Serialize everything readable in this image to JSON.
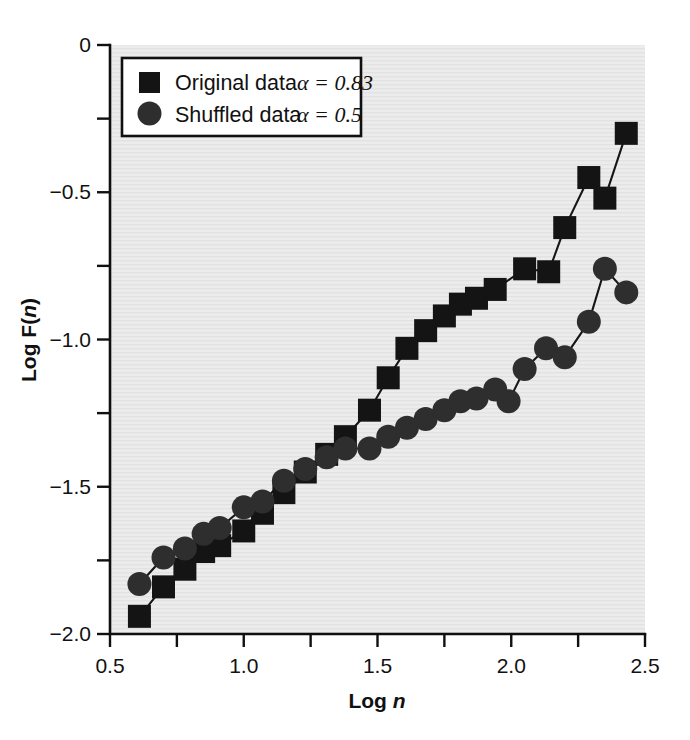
{
  "figure": {
    "background_color": "#ffffff",
    "plot_background_color": "#ececec",
    "axis_color": "#101010"
  },
  "chart_data": {
    "type": "line",
    "title": "",
    "subtitle": "",
    "xlabel_prefix": "Log ",
    "xlabel_italic": "n",
    "ylabel_prefix": "Log F(",
    "ylabel_italic": "n",
    "ylabel_suffix": ")",
    "xlim": [
      0.5,
      2.5
    ],
    "ylim": [
      -2.0,
      0.0
    ],
    "grid": false,
    "xticks": [
      0.5,
      1.0,
      1.5,
      2.0,
      2.5
    ],
    "xticklabels": [
      "0.5",
      "1.0",
      "1.5",
      "2.0",
      "2.5"
    ],
    "xticks_minor": [
      0.75,
      1.25,
      1.75,
      2.25
    ],
    "yticks": [
      0.0,
      -0.5,
      -1.0,
      -1.5,
      -2.0
    ],
    "yticklabels": [
      "0",
      "−0.5",
      "−1.0",
      "−1.5",
      "−2.0"
    ],
    "yticks_minor": [
      -0.25,
      -0.75,
      -1.25,
      -1.75
    ],
    "legend_position": "upper-left",
    "series": [
      {
        "name": "Original data",
        "alpha_label": "α = 0.83",
        "alpha_value": 0.83,
        "marker": "square",
        "color": "#141414",
        "x": [
          0.61,
          0.7,
          0.78,
          0.85,
          0.91,
          1.0,
          1.07,
          1.15,
          1.23,
          1.31,
          1.38,
          1.47,
          1.54,
          1.61,
          1.68,
          1.75,
          1.81,
          1.87,
          1.94,
          2.05,
          2.14,
          2.2,
          2.29,
          2.35,
          2.43
        ],
        "y": [
          -1.94,
          -1.84,
          -1.78,
          -1.72,
          -1.7,
          -1.65,
          -1.59,
          -1.52,
          -1.45,
          -1.39,
          -1.33,
          -1.24,
          -1.13,
          -1.03,
          -0.97,
          -0.92,
          -0.88,
          -0.86,
          -0.83,
          -0.76,
          -0.77,
          -0.62,
          -0.45,
          -0.52,
          -0.3
        ]
      },
      {
        "name": "Shuffled data",
        "alpha_label": "α = 0.5",
        "alpha_value": 0.5,
        "marker": "circle",
        "color": "#2e2e2e",
        "x": [
          0.61,
          0.7,
          0.78,
          0.85,
          0.91,
          1.0,
          1.07,
          1.15,
          1.23,
          1.31,
          1.38,
          1.47,
          1.54,
          1.61,
          1.68,
          1.75,
          1.81,
          1.87,
          1.94,
          1.99,
          2.05,
          2.13,
          2.2,
          2.29,
          2.35,
          2.43
        ],
        "y": [
          -1.83,
          -1.74,
          -1.71,
          -1.66,
          -1.64,
          -1.57,
          -1.55,
          -1.48,
          -1.44,
          -1.4,
          -1.37,
          -1.37,
          -1.33,
          -1.3,
          -1.27,
          -1.24,
          -1.21,
          -1.2,
          -1.17,
          -1.21,
          -1.1,
          -1.03,
          -1.06,
          -0.94,
          -0.76,
          -0.84
        ]
      }
    ]
  },
  "legend": {
    "entries": [
      {
        "label": "Original data",
        "alpha": "α = 0.83",
        "marker": "square"
      },
      {
        "label": "Shuffled data",
        "alpha": "α = 0.5",
        "marker": "circle"
      }
    ]
  }
}
